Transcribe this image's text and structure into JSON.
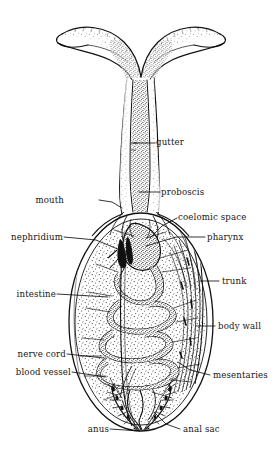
{
  "figure": {
    "type": "labeled-biological-diagram",
    "style": "stippled pen-and-ink line drawing, black on white",
    "background_color": "#ffffff",
    "ink_color": "#111111"
  },
  "labels": [
    {
      "id": "gutter",
      "text": "gutter",
      "side": "right",
      "x": 158,
      "y": 138,
      "leader_to": [
        134,
        143
      ]
    },
    {
      "id": "proboscis",
      "text": "proboscis",
      "side": "right",
      "x": 163,
      "y": 188,
      "leader_to": [
        139,
        192
      ]
    },
    {
      "id": "mouth",
      "text": "mouth",
      "side": "left",
      "x": 72,
      "y": 196,
      "leader_to": [
        122,
        207
      ]
    },
    {
      "id": "coelomic-space",
      "text": "coelomic space",
      "side": "right",
      "x": 180,
      "y": 213,
      "leader_to": [
        150,
        237
      ]
    },
    {
      "id": "nephridium",
      "text": "nephridium",
      "side": "left",
      "x": 18,
      "y": 233,
      "leader_to": [
        118,
        247
      ]
    },
    {
      "id": "pharynx",
      "text": "pharynx",
      "side": "right",
      "x": 208,
      "y": 233,
      "leader_to": [
        143,
        245
      ]
    },
    {
      "id": "trunk",
      "text": "trunk",
      "side": "right",
      "x": 222,
      "y": 277,
      "leader_to": [
        200,
        281
      ]
    },
    {
      "id": "intestine",
      "text": "intestine",
      "side": "left",
      "x": 14,
      "y": 290,
      "leader_to": [
        108,
        296
      ]
    },
    {
      "id": "body-wall",
      "text": "body wall",
      "side": "right",
      "x": 218,
      "y": 322,
      "leader_to": [
        196,
        327
      ]
    },
    {
      "id": "nerve-cord",
      "text": "nerve cord",
      "side": "left",
      "x": 14,
      "y": 350,
      "leader_to": [
        104,
        356
      ]
    },
    {
      "id": "blood-vessel",
      "text": "blood vessel",
      "side": "left",
      "x": 14,
      "y": 368,
      "leader_to": [
        106,
        375
      ]
    },
    {
      "id": "mesentaries",
      "text": "mesentaries",
      "side": "right",
      "x": 213,
      "y": 371,
      "leader_to": [
        186,
        364
      ]
    },
    {
      "id": "anus",
      "text": "anus",
      "side": "left",
      "x": 88,
      "y": 425,
      "leader_to": [
        140,
        430
      ]
    },
    {
      "id": "anal-sac",
      "text": "anal sac",
      "side": "right",
      "x": 183,
      "y": 425,
      "leader_to": [
        158,
        412
      ]
    }
  ],
  "structures": [
    {
      "id": "proboscis-lobes",
      "name": "bifurcated proboscis with two lateral lobes"
    },
    {
      "id": "proboscis-stalk",
      "name": "proboscis stalk with ciliated gutter groove"
    },
    {
      "id": "trunk-body",
      "name": "ovoid trunk / body"
    },
    {
      "id": "coiled-intestine",
      "name": "long coiled intestine"
    },
    {
      "id": "anal-sacs",
      "name": "paired branching anal sacs"
    },
    {
      "id": "body-wall-muscle",
      "name": "longitudinal body wall musculature"
    }
  ]
}
